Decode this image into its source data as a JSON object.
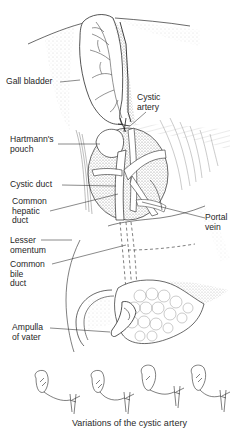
{
  "figure": {
    "labels": {
      "gall_bladder": "Gall bladder",
      "cystic_artery": [
        "Cystic",
        "artery"
      ],
      "hartmanns_pouch": [
        "Hartmann's",
        "pouch"
      ],
      "cystic_duct": "Cystic duct",
      "common_hepatic_duct": [
        "Common",
        "hepatic",
        "duct"
      ],
      "portal_vein": [
        "Portal",
        "vein"
      ],
      "lesser_omentum": [
        "Lesser",
        "omentum"
      ],
      "common_bile_duct": [
        "Common",
        "bile",
        "duct"
      ],
      "ampulla_of_vater": [
        "Ampulla",
        "of vater"
      ]
    },
    "caption": "Variations of the cystic artery",
    "variation_count": 4,
    "colors": {
      "ink": "#2a2a2a",
      "stipple": "#9a9a9a",
      "shade": "#c8c8c8",
      "background": "#ffffff"
    }
  }
}
